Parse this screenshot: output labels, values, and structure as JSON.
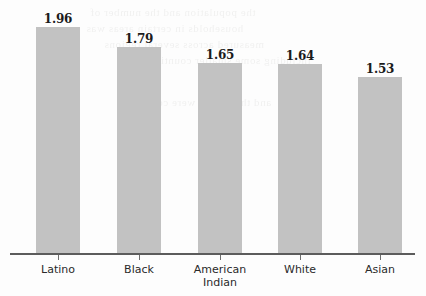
{
  "chart_data": {
    "type": "bar",
    "title": "",
    "subtitle": "",
    "xlabel": "",
    "ylabel": "",
    "categories": [
      "Latino",
      "Black",
      "American Indian",
      "White",
      "Asian"
    ],
    "category_lines": [
      [
        "Latino"
      ],
      [
        "Black"
      ],
      [
        "American",
        "Indian"
      ],
      [
        "White"
      ],
      [
        "Asian"
      ]
    ],
    "values": [
      1.96,
      1.79,
      1.65,
      1.64,
      1.53
    ],
    "value_labels": [
      "1.96",
      "1.79",
      "1.65",
      "1.64",
      "1.53"
    ],
    "ylim": [
      0,
      2.25
    ],
    "grid": false,
    "legend": null,
    "bar_color": "#c2c2c2",
    "axis_color": "#5c5c5c",
    "background_color": "#fdfdfd",
    "label_color": "#1b1b1b"
  },
  "background_artifacts": {
    "description": "faint mirrored show-through text from reverse of scanned page",
    "lines": [
      "the population and the number of",
      "households in certain areas was",
      "measured across several regions",
      "including some smaller counties",
      "and the results were compared"
    ]
  }
}
